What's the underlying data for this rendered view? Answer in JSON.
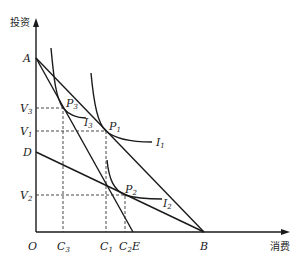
{
  "diagram": {
    "axes": {
      "y_label": "投资",
      "x_label": "消费",
      "origin_label": "O"
    },
    "points": {
      "A": "A",
      "D": "D",
      "B": "B",
      "E": "E",
      "P1": {
        "base": "P",
        "sub": "1"
      },
      "P2": {
        "base": "P",
        "sub": "2"
      },
      "P3": {
        "base": "P",
        "sub": "3"
      }
    },
    "y_ticks": [
      {
        "base": "V",
        "sub": "3"
      },
      {
        "base": "V",
        "sub": "1"
      },
      {
        "base": "V",
        "sub": "2"
      }
    ],
    "x_ticks": [
      {
        "base": "C",
        "sub": "3"
      },
      {
        "base": "C",
        "sub": "1"
      },
      {
        "base": "C",
        "sub": "2"
      }
    ],
    "curves": [
      {
        "base": "I",
        "sub": "1"
      },
      {
        "base": "I",
        "sub": "2"
      },
      {
        "base": "I",
        "sub": "3"
      }
    ]
  }
}
